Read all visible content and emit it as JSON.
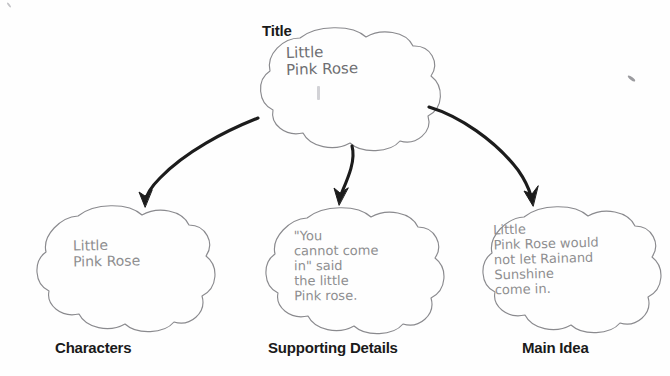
{
  "worksheet": {
    "type": "story-elements-graphic-organizer",
    "bubble_shape": "cloud-flower",
    "ink_color": "#8e8e90",
    "label_color": "#1a1a1a",
    "background_color": "#fefefe"
  },
  "nodes": {
    "title": {
      "label": "Title",
      "handwriting": "Little\nPink Rose",
      "position": "top-center"
    },
    "characters": {
      "label": "Characters",
      "handwriting": "Little\nPink Rose",
      "position": "bottom-left"
    },
    "supporting_details": {
      "label": "Supporting Details",
      "handwriting": "\"You\ncannot come\nin\" said\nthe little\nPink rose.",
      "position": "bottom-center"
    },
    "main_idea": {
      "label": "Main Idea",
      "handwriting": "Little\nPink Rose would\nnot let Rainand\nSunshine\ncome in.",
      "position": "bottom-right"
    }
  },
  "connectors": [
    {
      "name": "title-to-characters",
      "from": "title",
      "to": "characters",
      "style": "curved-arrow-left"
    },
    {
      "name": "title-to-supporting-details",
      "from": "title",
      "to": "supporting_details",
      "style": "straight-arrow-down"
    },
    {
      "name": "title-to-main-idea",
      "from": "title",
      "to": "main_idea",
      "style": "curved-arrow-right"
    }
  ]
}
